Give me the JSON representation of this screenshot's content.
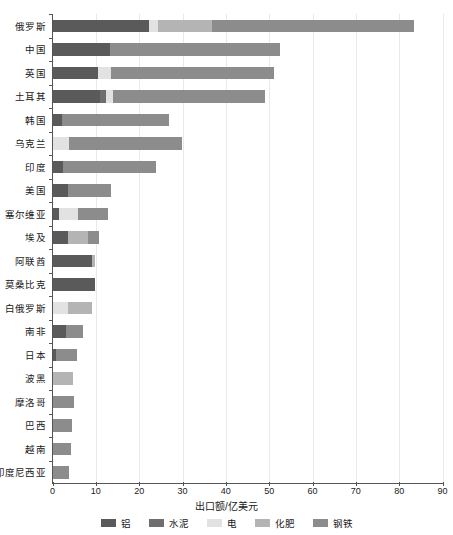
{
  "chart_data": {
    "type": "bar",
    "orientation": "horizontal",
    "stacked": true,
    "title": "",
    "xlabel": "出口额/亿美元",
    "ylabel": "",
    "xlim": [
      0,
      90
    ],
    "xticks": [
      0,
      10,
      20,
      30,
      40,
      50,
      60,
      70,
      80,
      90
    ],
    "grid": "vertical",
    "legend_position": "bottom",
    "categories": [
      "俄罗斯",
      "中国",
      "英国",
      "土耳其",
      "韩国",
      "乌克兰",
      "印度",
      "美国",
      "塞尔维亚",
      "埃及",
      "阿联酋",
      "莫桑比克",
      "白俄罗斯",
      "南非",
      "日本",
      "波黑",
      "摩洛哥",
      "巴西",
      "越南",
      "印度尼西亚"
    ],
    "series": [
      {
        "name": "铝",
        "color": "#5a5a5a",
        "values": [
          22.3,
          13.3,
          10.5,
          10.9,
          2.2,
          0.0,
          2.4,
          3.6,
          1.6,
          3.6,
          9.0,
          9.9,
          0.0,
          3.0,
          0.8,
          0.0,
          0.0,
          0.0,
          0.0,
          0.0
        ]
      },
      {
        "name": "水泥",
        "color": "#6e6e6e",
        "values": [
          0.0,
          0.0,
          0.0,
          1.5,
          0.0,
          0.0,
          0.0,
          0.0,
          0.0,
          0.0,
          0.0,
          0.0,
          0.0,
          0.0,
          0.0,
          0.0,
          0.0,
          0.0,
          0.0,
          0.0
        ]
      },
      {
        "name": "电",
        "color": "#e2e2e2",
        "values": [
          2.1,
          0.0,
          3.1,
          1.6,
          0.0,
          3.9,
          0.0,
          0.0,
          4.3,
          0.0,
          0.0,
          0.0,
          3.6,
          0.0,
          0.0,
          0.0,
          0.0,
          0.0,
          0.0,
          0.0
        ]
      },
      {
        "name": "化肥",
        "color": "#b4b4b4",
        "values": [
          12.4,
          0.0,
          0.0,
          0.0,
          0.0,
          0.0,
          0.0,
          0.0,
          0.0,
          4.6,
          0.7,
          0.0,
          5.5,
          0.0,
          0.0,
          4.7,
          0.0,
          0.0,
          0.0,
          0.0
        ]
      },
      {
        "name": "钢铁",
        "color": "#8c8c8c",
        "values": [
          46.6,
          39.2,
          37.5,
          35.1,
          24.8,
          26.1,
          21.6,
          10.0,
          6.9,
          2.5,
          0.0,
          0.0,
          0.0,
          4.0,
          4.9,
          0.0,
          4.9,
          4.5,
          4.3,
          3.8
        ]
      }
    ],
    "totals": [
      83.4,
      52.5,
      51.1,
      49.1,
      27.0,
      30.0,
      24.0,
      13.6,
      12.8,
      10.7,
      9.7,
      9.9,
      9.1,
      7.0,
      5.7,
      4.7,
      4.9,
      4.5,
      4.3,
      3.8
    ]
  }
}
